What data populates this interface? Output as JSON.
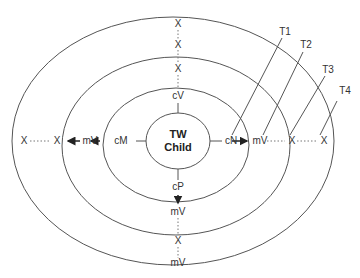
{
  "center": {
    "line1": "TW",
    "line2": "Child"
  },
  "colors": {
    "stroke": "#555555",
    "text": "#333333"
  },
  "rings": [
    {
      "id": "ring-inner",
      "label": "TW Child"
    },
    {
      "id": "ring-2"
    },
    {
      "id": "ring-3"
    },
    {
      "id": "ring-4"
    }
  ],
  "labels": {
    "cV": "cV",
    "cM": "cM",
    "cN": "cN",
    "cP": "cP",
    "top_x1": "X",
    "top_x2": "X",
    "top_x3": "X",
    "left_mV": "mV",
    "left_x1": "X",
    "left_x2": "X",
    "right_mV": "mV",
    "right_x1": "X",
    "right_x2": "X",
    "bottom_mV1": "mV",
    "bottom_x": "X",
    "bottom_mV2": "mV"
  },
  "time_labels": [
    "T1",
    "T2",
    "T3",
    "T4"
  ]
}
